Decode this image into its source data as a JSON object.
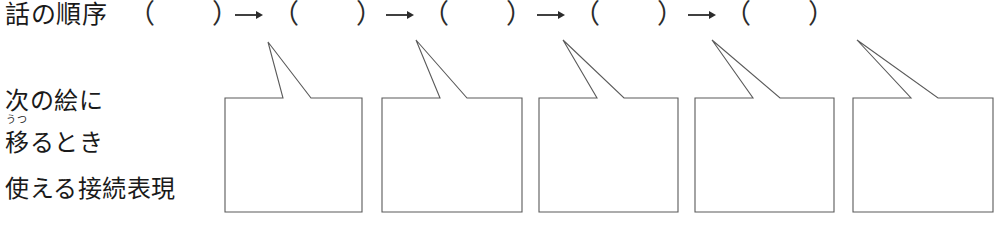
{
  "document": {
    "title": "話の順序と接続表現ワークシート",
    "background_color": "#ffffff",
    "ink_color": "#1a1a1a",
    "line_color": "#5a5a5a"
  },
  "sequence_row": {
    "label": "話の順序",
    "open_paren": "（",
    "close_paren": "）",
    "arrow_glyph": "→",
    "arrow_icon_name": "right-arrow-icon",
    "slot_count": 5,
    "arrow_count": 4,
    "slots": [
      {
        "index": 1,
        "value": "",
        "placeholder": ""
      },
      {
        "index": 2,
        "value": "",
        "placeholder": ""
      },
      {
        "index": 3,
        "value": "",
        "placeholder": ""
      },
      {
        "index": 4,
        "value": "",
        "placeholder": ""
      },
      {
        "index": 5,
        "value": "",
        "placeholder": ""
      }
    ]
  },
  "labels": {
    "line1": "次の絵に",
    "line2_ruby": "うつ",
    "line2_base": "移",
    "line2_rest": "るとき",
    "line3": "使える接続表現"
  },
  "bubbles": [
    {
      "index": 1,
      "value": "",
      "placeholder": ""
    },
    {
      "index": 2,
      "value": "",
      "placeholder": ""
    },
    {
      "index": 3,
      "value": "",
      "placeholder": ""
    },
    {
      "index": 4,
      "value": "",
      "placeholder": ""
    },
    {
      "index": 5,
      "value": "",
      "placeholder": ""
    }
  ]
}
